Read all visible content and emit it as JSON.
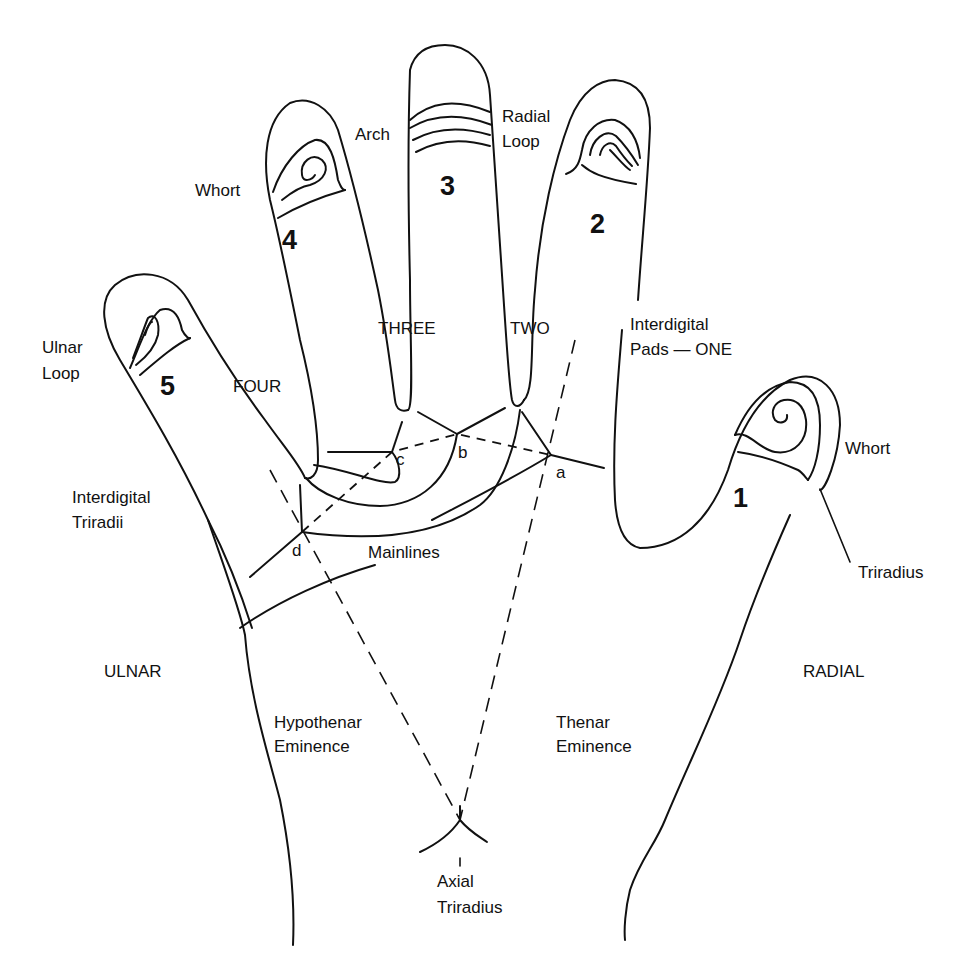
{
  "diagram": {
    "digits": [
      {
        "number": "1",
        "pattern": "Whort"
      },
      {
        "number": "2",
        "pattern": "Radial Loop"
      },
      {
        "number": "3",
        "pattern": "Arch"
      },
      {
        "number": "4",
        "pattern": "Whort"
      },
      {
        "number": "5",
        "pattern": "Ulnar Loop"
      }
    ],
    "labels": {
      "digit1": "1",
      "digit2": "2",
      "digit3": "3",
      "digit4": "4",
      "digit5": "5",
      "whort_4": "Whort",
      "arch_3": "Arch",
      "radial_loop_line1": "Radial",
      "radial_loop_line2": "Loop",
      "ulnar_loop_line1": "Ulnar",
      "ulnar_loop_line2": "Loop",
      "whort_1": "Whort",
      "pad_three": "THREE",
      "pad_two": "TWO",
      "pad_four": "FOUR",
      "pads_one_line1": "Interdigital",
      "pads_one_line2": "Pads — ONE",
      "triradii_line1": "Interdigital",
      "triradii_line2": "Triradii",
      "mainlines": "Mainlines",
      "triradius": "Triradius",
      "tri_a": "a",
      "tri_b": "b",
      "tri_c": "c",
      "tri_d": "d",
      "ulnar": "ULNAR",
      "radial": "RADIAL",
      "hypothenar_line1": "Hypothenar",
      "hypothenar_line2": "Eminence",
      "thenar_line1": "Thenar",
      "thenar_line2": "Eminence",
      "axial_line1": "Axial",
      "axial_line2": "Triradius"
    },
    "colors": {
      "ink": "#111111",
      "background": "#ffffff"
    }
  }
}
